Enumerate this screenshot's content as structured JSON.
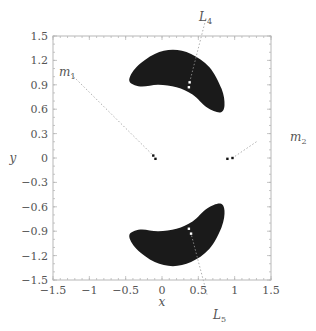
{
  "chart_data": {
    "type": "scatter",
    "title": "",
    "xlabel": "x",
    "ylabel": "y",
    "xlim": [
      -1.5,
      1.5
    ],
    "ylim": [
      -1.5,
      1.5
    ],
    "grid": false,
    "legend": "none",
    "x_ticks": [
      -1.5,
      -1,
      -0.5,
      0,
      0.5,
      1,
      1.5
    ],
    "x_tick_labels": [
      "−1.5",
      "−1",
      "−0.5",
      "0",
      "0.5",
      "1",
      "1.5"
    ],
    "y_ticks": [
      1.5,
      1.2,
      0.9,
      0.6,
      0.3,
      0,
      -0.3,
      -0.6,
      -0.9,
      -1.2,
      -1.5
    ],
    "y_tick_labels": [
      "1.5",
      "1.2",
      "0.9",
      "0.6",
      "0.3",
      "0",
      "−0.3",
      "−0.6",
      "−0.9",
      "−1.2",
      "−1.5"
    ],
    "regions": [
      {
        "name": "upper crescent (around L4)",
        "color": "#1a1a1a",
        "outline": [
          [
            -0.45,
            0.95
          ],
          [
            -0.35,
            1.12
          ],
          [
            -0.1,
            1.28
          ],
          [
            0.15,
            1.33
          ],
          [
            0.4,
            1.28
          ],
          [
            0.65,
            1.12
          ],
          [
            0.82,
            0.85
          ],
          [
            0.86,
            0.65
          ],
          [
            0.8,
            0.56
          ],
          [
            0.62,
            0.62
          ],
          [
            0.42,
            0.78
          ],
          [
            0.2,
            0.87
          ],
          [
            -0.05,
            0.9
          ],
          [
            -0.3,
            0.88
          ],
          [
            -0.45,
            0.95
          ]
        ]
      },
      {
        "name": "lower crescent (around L5)",
        "color": "#1a1a1a",
        "outline": [
          [
            -0.45,
            -0.95
          ],
          [
            -0.35,
            -1.12
          ],
          [
            -0.1,
            -1.28
          ],
          [
            0.15,
            -1.33
          ],
          [
            0.4,
            -1.28
          ],
          [
            0.65,
            -1.12
          ],
          [
            0.82,
            -0.85
          ],
          [
            0.86,
            -0.65
          ],
          [
            0.8,
            -0.56
          ],
          [
            0.62,
            -0.62
          ],
          [
            0.42,
            -0.78
          ],
          [
            0.2,
            -0.87
          ],
          [
            -0.05,
            -0.9
          ],
          [
            -0.3,
            -0.88
          ],
          [
            -0.45,
            -0.95
          ]
        ]
      }
    ],
    "points": [
      {
        "label": "m1",
        "x": -0.12,
        "y": 0.03
      },
      {
        "label": "m1",
        "x": -0.09,
        "y": -0.01
      },
      {
        "label": "m2",
        "x": 0.9,
        "y": -0.01
      },
      {
        "label": "m2",
        "x": 0.97,
        "y": 0.0
      },
      {
        "label": "L4",
        "x": 0.38,
        "y": 0.93
      },
      {
        "label": "L4",
        "x": 0.37,
        "y": 0.87
      },
      {
        "label": "L5",
        "x": 0.37,
        "y": -0.87
      },
      {
        "label": "L5",
        "x": 0.4,
        "y": -0.93
      }
    ],
    "annotations": [
      {
        "text": "m",
        "sub": "1",
        "label_pos": [
          -1.3,
          1.08
        ],
        "target": [
          -0.12,
          0.03
        ]
      },
      {
        "text": "m",
        "sub": "2",
        "label_pos": [
          1.32,
          0.22
        ],
        "target": [
          0.97,
          0.0
        ]
      },
      {
        "text": "L",
        "sub": "4",
        "label_pos": [
          0.6,
          1.72
        ],
        "target": [
          0.38,
          0.93
        ]
      },
      {
        "text": "L",
        "sub": "5",
        "label_pos": [
          0.62,
          -1.72
        ],
        "target": [
          0.4,
          -0.93
        ]
      }
    ]
  },
  "labels": {
    "xlabel": "x",
    "ylabel": "y",
    "m1_main": "m",
    "m1_sub": "1",
    "m2_main": "m",
    "m2_sub": "2",
    "L4_main": "L",
    "L4_sub": "4",
    "L5_main": "L",
    "L5_sub": "5"
  }
}
